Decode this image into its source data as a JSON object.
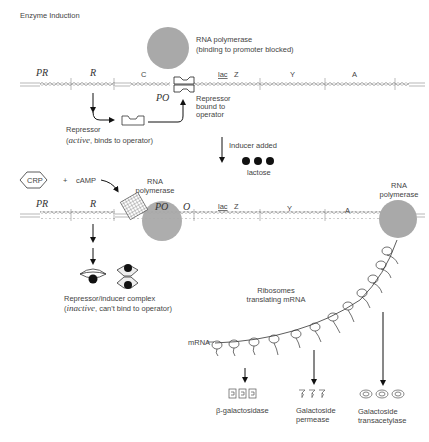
{
  "title": "Enzyme Induction",
  "top": {
    "rna_polymerase_label": "RNA polymerase",
    "rna_polymerase_sub": "(binding to promoter blocked)",
    "genes": {
      "PR": "PR",
      "R": "R",
      "C": "C",
      "PO": "PO",
      "lac": "lac",
      "Z": "Z",
      "Y": "Y",
      "A": "A"
    },
    "repressor_bound": [
      "Repressor",
      "bound to",
      "operator"
    ],
    "repressor_label": "Repressor",
    "repressor_state_italic": "active",
    "repressor_state_rest": ", binds to operator)",
    "repressor_state_open": "("
  },
  "transition": {
    "inducer_label": "Inducer added",
    "lactose_label": "lactose"
  },
  "bottom": {
    "crp": "CRP",
    "plus": "+",
    "camp": "cAMP",
    "rna_polymerase_1": [
      "RNA",
      "polymerase"
    ],
    "rna_polymerase_2": [
      "RNA",
      "polymerase"
    ],
    "genes": {
      "PR": "PR",
      "R": "R",
      "PO": "PO",
      "O": "O",
      "lac": "lac",
      "Z": "Z",
      "Y": "Y",
      "A": "A"
    },
    "complex_label": "Repressor/inducer complex",
    "complex_state_open": "(",
    "complex_state_italic": "inactive",
    "complex_state_rest": ", can't bind to operator)",
    "ribosomes_label": [
      "Ribosomes",
      "translating mRNA"
    ],
    "mrna_label": "mRNA"
  },
  "products": [
    {
      "name": "beta-galactosidase",
      "label": [
        "β-galactosidase"
      ]
    },
    {
      "name": "galactoside-permease",
      "label": [
        "Galactoside",
        "permease"
      ]
    },
    {
      "name": "galactoside-transacetylase",
      "label": [
        "Galactoside",
        "transacetylase"
      ]
    }
  ],
  "colors": {
    "polymerase": "#a9a9a9",
    "line": "#222222",
    "text": "#444444"
  }
}
